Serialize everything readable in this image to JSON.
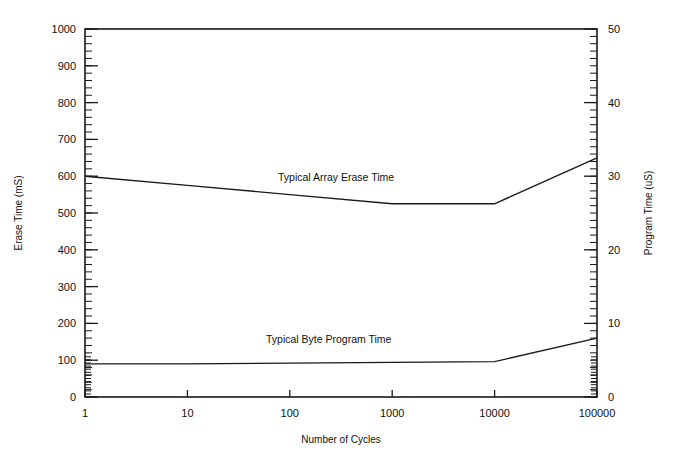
{
  "chart_data": {
    "type": "line",
    "title": "",
    "xlabel": "Number of Cycles",
    "ylabel": "Erase Time (mS)",
    "y2label": "Program Time (uS)",
    "xscale": "log",
    "xlim": [
      1,
      100000
    ],
    "xticks": [
      1,
      10,
      100,
      1000,
      10000,
      100000
    ],
    "xticklabels": [
      "1",
      "10",
      "100",
      "1000",
      "10000",
      "100000"
    ],
    "ylim": [
      0,
      1000
    ],
    "yticks": [
      0,
      100,
      200,
      300,
      400,
      500,
      600,
      700,
      800,
      900,
      1000
    ],
    "yticklabels": [
      "0",
      "100",
      "200",
      "300",
      "400",
      "500",
      "600",
      "700",
      "800",
      "900",
      "1000"
    ],
    "y2lim": [
      0,
      50
    ],
    "y2ticks": [
      0,
      10,
      20,
      30,
      40,
      50
    ],
    "y2ticklabels": [
      "0",
      "10",
      "20",
      "30",
      "40",
      "50"
    ],
    "grid": false,
    "legend": "inline-annotations",
    "series": [
      {
        "name": "Typical Array Erase Time",
        "axis": "left",
        "unit": "mS",
        "x": [
          1,
          10,
          100,
          1000,
          10000,
          100000
        ],
        "values": [
          600,
          575,
          550,
          525,
          525,
          650
        ],
        "annotation": "Typical Array Erase Time"
      },
      {
        "name": "Typical Byte Program Time",
        "axis": "right",
        "unit": "uS",
        "x": [
          1,
          10,
          100,
          1000,
          10000,
          100000
        ],
        "values": [
          4.5,
          4.5,
          4.6,
          4.7,
          4.8,
          8.0
        ],
        "annotation": "Typical Byte Program Time"
      }
    ],
    "colors": {
      "line": "#1a1a1a",
      "axis": "#1a1a1a",
      "background": "#ffffff"
    }
  },
  "annotations": {
    "erase": "Typical Array Erase Time",
    "program": "Typical Byte Program Time"
  },
  "axes": {
    "x_title": "Number of Cycles",
    "y_left_title": "Erase Time (mS)",
    "y_right_title": "Program Time (uS)"
  },
  "ticks": {
    "x": [
      "1",
      "10",
      "100",
      "1000",
      "10000",
      "100000"
    ],
    "y_left": [
      "1000",
      "900",
      "800",
      "700",
      "600",
      "500",
      "400",
      "300",
      "200",
      "100",
      "0"
    ],
    "y_right": [
      "50",
      "40",
      "30",
      "20",
      "10",
      "0"
    ]
  }
}
